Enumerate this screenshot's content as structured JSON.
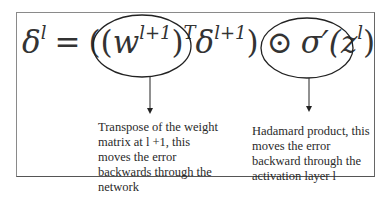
{
  "equation": {
    "lhs": "δ",
    "lhs_sup": "l",
    "equals": "=",
    "open_paren": "((",
    "w": "w",
    "w_sup": "l+1",
    "close_paren": ")",
    "T": "T",
    "delta2": "δ",
    "delta2_sup": "l+1",
    "close2": ")",
    "hadamard": "⊙",
    "sigma": "σ′(z",
    "z_sup": "l",
    "close3": ")"
  },
  "annotations": [
    {
      "target": "(w^{l+1})^T",
      "text_lines": [
        "Transpose of the weight",
        "matrix at l +1, this",
        "moves the error",
        "backwards through the",
        "network"
      ]
    },
    {
      "target": "⊙ σ'(z^l)",
      "text_lines": [
        "Hadamard product, this",
        "moves the error",
        "backward through the",
        "activation  layer l"
      ]
    }
  ]
}
